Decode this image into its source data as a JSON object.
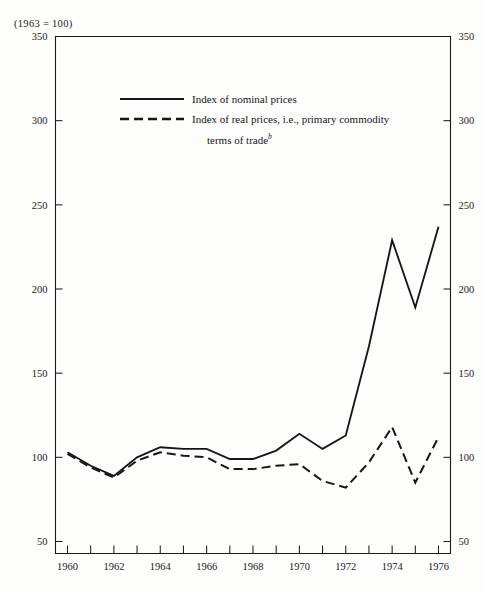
{
  "base_note": "(1963 = 100)",
  "legend": {
    "nominal_label": "Index of nominal prices",
    "real_label": "Index of real prices, i.e., primary commodity",
    "real_label_cont": "terms of trade",
    "real_label_footnote": "b"
  },
  "chart_data": {
    "type": "line",
    "title": "",
    "subtitle": "(1963 = 100)",
    "xlabel": "",
    "ylabel": "",
    "xlim": [
      1960,
      1976
    ],
    "ylim": [
      50,
      350
    ],
    "grid": false,
    "legend_position": "upper-left-inside",
    "yticks": [
      50,
      100,
      150,
      200,
      250,
      300,
      350
    ],
    "ytick_labels": [
      "50",
      "100",
      "150",
      "200",
      "250",
      "300",
      "350"
    ],
    "y_axis_both_sides": true,
    "x": [
      1960,
      1961,
      1962,
      1963,
      1964,
      1965,
      1966,
      1967,
      1968,
      1969,
      1970,
      1971,
      1972,
      1973,
      1974,
      1975,
      1976
    ],
    "xticks": [
      1960,
      1961,
      1962,
      1963,
      1964,
      1965,
      1966,
      1967,
      1968,
      1969,
      1970,
      1971,
      1972,
      1973,
      1974,
      1975,
      1976
    ],
    "xtick_labels": [
      "1960",
      "",
      "1962",
      "",
      "1964",
      "",
      "1966",
      "",
      "1968",
      "",
      "1970",
      "",
      "1972",
      "",
      "1974",
      "",
      "1976"
    ],
    "series": [
      {
        "name": "Index of nominal prices",
        "style": "solid",
        "values": [
          103,
          95,
          89,
          100,
          106,
          105,
          105,
          99,
          99,
          104,
          114,
          105,
          113,
          166,
          229,
          189,
          237
        ]
      },
      {
        "name": "Index of real prices, i.e., primary commodity terms of trade",
        "style": "dashed",
        "values": [
          102,
          94,
          88,
          98,
          103,
          101,
          100,
          93,
          93,
          95,
          96,
          86,
          82,
          97,
          118,
          85,
          112
        ]
      }
    ]
  }
}
